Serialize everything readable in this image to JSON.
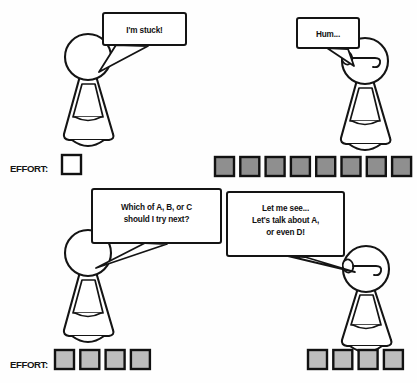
{
  "scene": {
    "title": "Effort comic strip",
    "width": 417,
    "height": 383,
    "background_color": "#fefefe",
    "ink_color": "#141414"
  },
  "panels": [
    {
      "id": "top-left",
      "speaker": "student",
      "bubble": {
        "lines": [
          "I'm stuck!"
        ],
        "x": 103,
        "y": 13,
        "w": 83,
        "h": 32
      },
      "figure": {
        "x": 55,
        "y": 38,
        "has_face": false
      },
      "effort": {
        "label": "EFFORT:",
        "filled": 0,
        "empty": 1,
        "total": 1,
        "fill_color": "#ffffff"
      }
    },
    {
      "id": "top-right",
      "speaker": "tutor",
      "bubble": {
        "lines": [
          "Hum..."
        ],
        "x": 297,
        "y": 18,
        "w": 62,
        "h": 30
      },
      "figure": {
        "x": 330,
        "y": 40,
        "has_face": true
      },
      "effort": {
        "label": "",
        "filled": 8,
        "empty": 0,
        "total": 8,
        "fill_color": "#8f8f8f"
      }
    },
    {
      "id": "bottom-left",
      "speaker": "student",
      "bubble": {
        "lines": [
          "Which of A, B, or C",
          "should I try next?"
        ],
        "x": 92,
        "y": 189,
        "w": 129,
        "h": 54
      },
      "figure": {
        "x": 55,
        "y": 229,
        "has_face": false
      },
      "effort": {
        "label": "EFFORT:",
        "filled": 4,
        "empty": 0,
        "total": 4,
        "fill_color": "#bdbdbd"
      }
    },
    {
      "id": "bottom-right",
      "speaker": "tutor",
      "bubble": {
        "lines": [
          "Let me see...",
          "Let's talk about A,",
          "or even D!"
        ],
        "x": 227,
        "y": 192,
        "w": 117,
        "h": 64
      },
      "figure": {
        "x": 338,
        "y": 245,
        "has_face": true
      },
      "effort": {
        "label": "",
        "filled": 4,
        "empty": 0,
        "total": 4,
        "fill_color": "#bdbdbd"
      }
    }
  ],
  "effort_rows": [
    {
      "id": "effort-row-top-left",
      "label": "EFFORT:",
      "label_x": 10,
      "label_y": 172,
      "cells_x": 62,
      "cells_y": 155,
      "cells": [
        {
          "state": "empty"
        }
      ]
    },
    {
      "id": "effort-row-top-right",
      "label": "",
      "label_x": 0,
      "label_y": 0,
      "cells_x": 215,
      "cells_y": 157,
      "cells": [
        {
          "state": "filled"
        },
        {
          "state": "filled"
        },
        {
          "state": "filled"
        },
        {
          "state": "filled"
        },
        {
          "state": "filled"
        },
        {
          "state": "filled"
        },
        {
          "state": "filled"
        },
        {
          "state": "filled"
        }
      ]
    },
    {
      "id": "effort-row-bottom-left",
      "label": "EFFORT:",
      "label_x": 10,
      "label_y": 368,
      "cells_x": 55,
      "cells_y": 350,
      "cells": [
        {
          "state": "filled-light"
        },
        {
          "state": "filled-light"
        },
        {
          "state": "filled-light"
        },
        {
          "state": "filled-light"
        }
      ]
    },
    {
      "id": "effort-row-bottom-right",
      "label": "",
      "label_x": 0,
      "label_y": 0,
      "cells_x": 308,
      "cells_y": 350,
      "cells": [
        {
          "state": "filled-light"
        },
        {
          "state": "filled-light"
        },
        {
          "state": "filled-light"
        },
        {
          "state": "filled-light"
        }
      ]
    }
  ],
  "text": {
    "bubble_tl_line1": "I'm stuck!",
    "bubble_tr_line1": "Hum...",
    "bubble_bl_line1": "Which of A, B, or C",
    "bubble_bl_line2": "should I try next?",
    "bubble_br_line1": "Let me see...",
    "bubble_br_line2": "Let's talk about A,",
    "bubble_br_line3": "or even D!",
    "effort_label_top": "EFFORT:",
    "effort_label_bottom": "EFFORT:"
  },
  "icons": {
    "figure": "pawn-figure-icon",
    "face": "face-profile-icon",
    "bubble": "speech-bubble-icon",
    "cell": "effort-cell-icon"
  }
}
